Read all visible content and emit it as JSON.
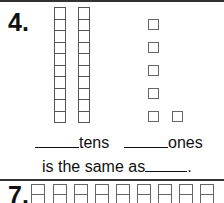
{
  "problem_4": {
    "number": "4.",
    "tens_columns": 2,
    "cells_per_column": 10,
    "ones_count": 6,
    "tens_label": "tens",
    "ones_label": "ones",
    "equivalence_text": "is the same as",
    "period": "."
  },
  "problem_7": {
    "number": "7.",
    "visible_columns": 9
  }
}
